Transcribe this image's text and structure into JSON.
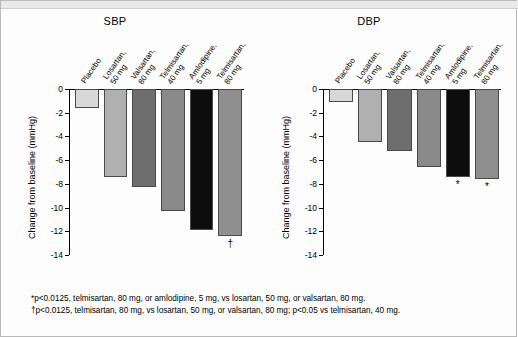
{
  "figure": {
    "footnotes": [
      "*p<0.0125, telmisartan, 80 mg, or amlodipine, 5 mg, vs losartan, 50 mg, or valsartan, 80 mg.",
      "†p<0.0125, telmisartan, 80 mg, vs losartan, 50 mg, or valsartan, 80 mg; p<0.05 vs telmisartan, 40 mg."
    ]
  },
  "chart_data": [
    {
      "type": "bar",
      "title": "SBP",
      "xlabel": "",
      "ylabel": "Change from baseline (mmHg)",
      "ylim": [
        -14,
        0
      ],
      "yticks": [
        "0",
        "-2",
        "-4",
        "-6",
        "-8",
        "-10",
        "-12",
        "-14"
      ],
      "ytick_values": [
        0,
        -2,
        -4,
        -6,
        -8,
        -10,
        -12,
        -14
      ],
      "grid": false,
      "categories": [
        "Placebo",
        "Losartan,\n50 mg",
        "Valsartan,\n80 mg",
        "Telmisartan,\n40 mg",
        "Amlodipine,\n5 mg",
        "Telmisartan,\n80 mg"
      ],
      "category_lines": [
        [
          "Placebo"
        ],
        [
          "Losartan,",
          "50 mg"
        ],
        [
          "Valsartan,",
          "80 mg"
        ],
        [
          "Telmisartan,",
          "40 mg"
        ],
        [
          "Amlodipine,",
          "5 mg"
        ],
        [
          "Telmisartan,",
          "80 mg"
        ]
      ],
      "values": [
        -1.6,
        -7.4,
        -8.3,
        -10.3,
        -11.9,
        -12.4
      ],
      "colors": [
        "#d8d8d8",
        "#b0b0b0",
        "#6e6e6e",
        "#898989",
        "#0d0d0d",
        "#8f8f8f"
      ],
      "annotations": [
        {
          "category": "Telmisartan,\n80 mg",
          "symbol": "†"
        }
      ]
    },
    {
      "type": "bar",
      "title": "DBP",
      "xlabel": "",
      "ylabel": "Change from baseline (mmHg)",
      "ylim": [
        -14,
        0
      ],
      "yticks": [
        "0",
        "-2",
        "-4",
        "-6",
        "-8",
        "-10",
        "-12",
        "-14"
      ],
      "ytick_values": [
        0,
        -2,
        -4,
        -6,
        -8,
        -10,
        -12,
        -14
      ],
      "grid": false,
      "categories": [
        "Placebo",
        "Losartan,\n50 mg",
        "Valsartan,\n80 mg",
        "Telmisartan,\n40 mg",
        "Amlodipine,\n5 mg",
        "Telmisartan,\n80 mg"
      ],
      "category_lines": [
        [
          "Placebo"
        ],
        [
          "Losartan,",
          "50 mg"
        ],
        [
          "Valsartan,",
          "80 mg"
        ],
        [
          "Telmisartan,",
          "40 mg"
        ],
        [
          "Amlodipine,",
          "5 mg"
        ],
        [
          "Telmisartan,",
          "80 mg"
        ]
      ],
      "values": [
        -1.1,
        -4.5,
        -5.2,
        -6.6,
        -7.4,
        -7.6
      ],
      "colors": [
        "#d8d8d8",
        "#b0b0b0",
        "#6e6e6e",
        "#898989",
        "#0d0d0d",
        "#8f8f8f"
      ],
      "annotations": [
        {
          "category": "Amlodipine,\n5 mg",
          "symbol": "*"
        },
        {
          "category": "Telmisartan,\n80 mg",
          "symbol": "*"
        }
      ]
    }
  ]
}
